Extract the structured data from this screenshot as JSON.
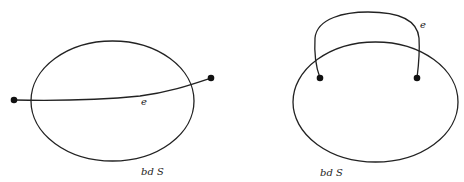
{
  "diagrams": [
    {
      "id": "left",
      "region_label": "bd S",
      "edge_label": "e",
      "description": "edge e crosses the boundary of region S, endpoints outside"
    },
    {
      "id": "right",
      "region_label": "bd S",
      "edge_label": "e",
      "description": "edge e arcs outside the boundary of S, endpoints inside"
    }
  ],
  "colors": {
    "ink": "#222222",
    "background": "#ffffff"
  }
}
